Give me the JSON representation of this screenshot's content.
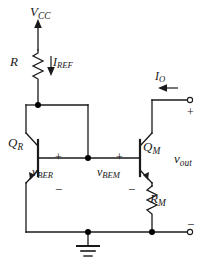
{
  "diagram": {
    "type": "schematic",
    "labels": {
      "supply": {
        "symbol": "V",
        "subscript": "CC"
      },
      "resistor_ref": {
        "symbol": "R",
        "subscript": ""
      },
      "current_ref": {
        "symbol": "I",
        "subscript": "REF"
      },
      "current_out": {
        "symbol": "I",
        "subscript": "O"
      },
      "transistor_ref": {
        "symbol": "Q",
        "subscript": "R"
      },
      "transistor_mirror": {
        "symbol": "Q",
        "subscript": "M"
      },
      "vbe_ref": {
        "symbol": "v",
        "subscript": "BER"
      },
      "vbe_mirror": {
        "symbol": "v",
        "subscript": "BEM"
      },
      "resistor_mirror": {
        "symbol": "R",
        "subscript": "M"
      },
      "voltage_out": {
        "symbol": "v",
        "subscript": "out"
      }
    },
    "polarity": {
      "plus_ref": "+",
      "minus_ref": "−",
      "plus_mirror": "+",
      "minus_mirror": "−",
      "plus_output": "+",
      "minus_output": "−"
    },
    "colors": {
      "wire": "#1a1a1a",
      "background": "#ffffff",
      "text": "#1a1a1a",
      "node": "#000000"
    },
    "nodes": {
      "supply_rail_x": 38,
      "base_rail_y": 158,
      "ground_rail_y": 232,
      "mirror_branch_x": 140,
      "output_terminal_x": 192
    },
    "components": [
      {
        "name": "R",
        "kind": "resistor",
        "orientation": "vertical"
      },
      {
        "name": "QR",
        "kind": "bjt-npn",
        "orientation": "mirrored"
      },
      {
        "name": "QM",
        "kind": "bjt-npn",
        "orientation": "normal"
      },
      {
        "name": "RM",
        "kind": "resistor",
        "orientation": "vertical"
      },
      {
        "name": "GND",
        "kind": "ground",
        "orientation": "down"
      }
    ]
  }
}
